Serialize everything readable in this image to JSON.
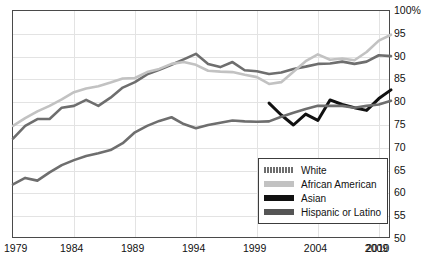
{
  "chart_data": {
    "type": "line",
    "title": "",
    "xlabel": "",
    "ylabel": "",
    "xlim": [
      1979,
      2010
    ],
    "ylim": [
      50,
      100
    ],
    "grid": true,
    "legend_position": "inside-bottom-right",
    "y_ticks": [
      "100%",
      "95",
      "90",
      "85",
      "80",
      "75",
      "70",
      "65",
      "60",
      "55",
      "50"
    ],
    "y_tick_values": [
      100,
      95,
      90,
      85,
      80,
      75,
      70,
      65,
      60,
      55,
      50
    ],
    "x_ticks": [
      "1979",
      "1984",
      "1989",
      "1994",
      "1999",
      "2004",
      "2009",
      "2010"
    ],
    "x_tick_values": [
      1979,
      1984,
      1989,
      1994,
      1999,
      2004,
      2009,
      2010
    ],
    "x_gridlines": [
      1984,
      1989,
      1994,
      1999,
      2004,
      2009
    ],
    "series": [
      {
        "name": "White",
        "color": "#6e6e6e",
        "x": [
          1979,
          1980,
          1981,
          1982,
          1983,
          1984,
          1985,
          1986,
          1987,
          1988,
          1989,
          1990,
          1991,
          1992,
          1993,
          1994,
          1995,
          1996,
          1997,
          1998,
          1999,
          2000,
          2001,
          2002,
          2003,
          2004,
          2005,
          2006,
          2007,
          2008,
          2009,
          2010
        ],
        "values": [
          72.0,
          74.8,
          76.3,
          76.3,
          78.8,
          79.2,
          80.5,
          79.2,
          81.0,
          83.2,
          84.4,
          86.1,
          87.1,
          88.2,
          89.4,
          90.6,
          88.4,
          87.7,
          88.8,
          87.0,
          86.8,
          86.2,
          86.5,
          87.3,
          87.8,
          88.4,
          88.5,
          88.9,
          88.4,
          88.9,
          90.3,
          90.1
        ]
      },
      {
        "name": "African American",
        "color": "#c2c2c2",
        "x": [
          1979,
          1980,
          1981,
          1982,
          1983,
          1984,
          1985,
          1986,
          1987,
          1988,
          1989,
          1990,
          1991,
          1992,
          1993,
          1994,
          1995,
          1996,
          1997,
          1998,
          1999,
          2000,
          2001,
          2002,
          2003,
          2004,
          2005,
          2006,
          2007,
          2008,
          2009,
          2010
        ],
        "values": [
          74.8,
          76.5,
          78.0,
          79.2,
          80.6,
          82.2,
          83.0,
          83.5,
          84.3,
          85.2,
          85.3,
          86.6,
          87.3,
          88.4,
          88.8,
          88.2,
          86.9,
          86.7,
          86.6,
          86.0,
          85.5,
          84.0,
          84.4,
          86.7,
          89.0,
          90.5,
          89.3,
          89.6,
          89.2,
          91.0,
          93.5,
          94.8
        ]
      },
      {
        "name": "Asian",
        "color": "#111111",
        "x": [
          2000,
          2001,
          2002,
          2003,
          2004,
          2005,
          2006,
          2007,
          2008,
          2009,
          2010
        ],
        "values": [
          79.8,
          77.2,
          75.0,
          77.4,
          76.0,
          80.5,
          79.5,
          78.8,
          78.2,
          80.8,
          82.7
        ]
      },
      {
        "name": "Hispanic or Latino",
        "color": "#6e6e6e",
        "x": [
          1979,
          1980,
          1981,
          1982,
          1983,
          1984,
          1985,
          1986,
          1987,
          1988,
          1989,
          1990,
          1991,
          1992,
          1993,
          1994,
          1995,
          1996,
          1997,
          1998,
          1999,
          2000,
          2001,
          2002,
          2003,
          2004,
          2005,
          2006,
          2007,
          2008,
          2009,
          2010
        ],
        "values": [
          62.0,
          63.4,
          62.8,
          64.6,
          66.2,
          67.3,
          68.2,
          68.8,
          69.5,
          71.0,
          73.4,
          74.8,
          75.9,
          76.7,
          75.2,
          74.3,
          75.0,
          75.5,
          76.0,
          75.8,
          75.7,
          75.8,
          76.8,
          77.7,
          78.5,
          79.2,
          79.2,
          79.2,
          78.8,
          79.2,
          79.5,
          80.3
        ]
      }
    ],
    "series_last_values": {
      "White": 90.1,
      "African American": 94.8,
      "Asian": 82.7,
      "Hispanic or Latino": 80.3
    }
  },
  "legend": {
    "entries": [
      {
        "label": "White",
        "color": "#6e6e6e",
        "pattern": "hatched"
      },
      {
        "label": "African American",
        "color": "#c2c2c2",
        "pattern": "solid"
      },
      {
        "label": "Asian",
        "color": "#111111",
        "pattern": "solid"
      },
      {
        "label": "Hispanic or Latino",
        "color": "#555555",
        "pattern": "solid"
      }
    ]
  },
  "axes": {
    "y_unit_label": "100%"
  }
}
